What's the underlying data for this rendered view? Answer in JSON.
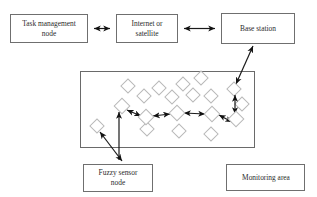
{
  "diagram": {
    "type": "block-diagram",
    "background_color": "#ffffff",
    "box_border_color": "#6f6f6f",
    "node_color": "#ffffff",
    "node_border_color": "#b9b9b9",
    "arrow_color": "#111111",
    "boxes": [
      {
        "id": "task-management-node",
        "label_line1": "Task management",
        "label_line2": "node",
        "x": 10,
        "y": 14,
        "w": 78,
        "h": 29
      },
      {
        "id": "internet-or-satellite",
        "label_line1": "Internet or",
        "label_line2": "satellite",
        "x": 116,
        "y": 14,
        "w": 62,
        "h": 29
      },
      {
        "id": "base-station",
        "label_line1": "Base station",
        "label_line2": "",
        "x": 221,
        "y": 13,
        "w": 74,
        "h": 31
      },
      {
        "id": "fuzzy-sensor-node",
        "label_line1": "Fuzzy sensor",
        "label_line2": "node",
        "x": 83,
        "y": 164,
        "w": 70,
        "h": 28
      },
      {
        "id": "monitoring-area",
        "label_line1": "Monitoring area",
        "label_line2": "",
        "x": 226,
        "y": 164,
        "w": 79,
        "h": 27
      }
    ],
    "field": {
      "id": "sensor-field",
      "x": 80,
      "y": 71,
      "w": 175,
      "h": 77
    },
    "connections": [
      {
        "id": "task-to-internet",
        "from": "task-management-node",
        "to": "internet-or-satellite",
        "style": "double-arrow"
      },
      {
        "id": "internet-to-base",
        "from": "internet-or-satellite",
        "to": "base-station",
        "style": "double-arrow"
      },
      {
        "id": "base-to-field",
        "from": "base-station",
        "to": "sensor-field",
        "style": "double-arrow"
      },
      {
        "id": "fuzzy-label-to-node-a",
        "from": "fuzzy-sensor-node",
        "to": "sensor-node",
        "style": "double-arrow"
      },
      {
        "id": "fuzzy-label-to-node-b",
        "from": "fuzzy-sensor-node",
        "to": "sensor-node",
        "style": "double-arrow"
      }
    ],
    "nodes": [
      {
        "x": 128,
        "y": 86
      },
      {
        "x": 159,
        "y": 88
      },
      {
        "x": 183,
        "y": 84
      },
      {
        "x": 200,
        "y": 78
      },
      {
        "x": 230,
        "y": 88
      },
      {
        "x": 144,
        "y": 96
      },
      {
        "x": 172,
        "y": 97
      },
      {
        "x": 193,
        "y": 95
      },
      {
        "x": 210,
        "y": 96
      },
      {
        "x": 122,
        "y": 106
      },
      {
        "x": 240,
        "y": 103
      },
      {
        "x": 97,
        "y": 125
      },
      {
        "x": 146,
        "y": 116
      },
      {
        "x": 177,
        "y": 113
      },
      {
        "x": 212,
        "y": 114
      },
      {
        "x": 234,
        "y": 89
      },
      {
        "x": 236,
        "y": 119
      },
      {
        "x": 147,
        "y": 128
      },
      {
        "x": 179,
        "y": 130
      },
      {
        "x": 210,
        "y": 134
      }
    ],
    "chain_nodes": [
      {
        "x": 122,
        "y": 106
      },
      {
        "x": 146,
        "y": 116
      },
      {
        "x": 177,
        "y": 113
      },
      {
        "x": 212,
        "y": 114
      },
      {
        "x": 236,
        "y": 119
      }
    ]
  }
}
